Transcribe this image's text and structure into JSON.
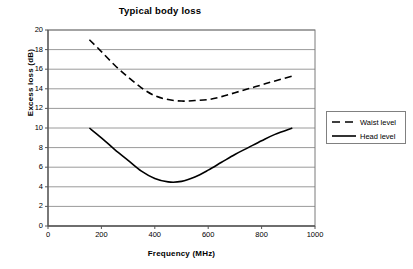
{
  "chart_data": {
    "type": "line",
    "title": "Typical body loss",
    "xlabel": "Frequency (MHz)",
    "ylabel": "Excess loss (dB)",
    "xlim": [
      0,
      1000
    ],
    "ylim": [
      0,
      20
    ],
    "xticks": [
      "0",
      "200",
      "400",
      "600",
      "800",
      "1000"
    ],
    "yticks": [
      "0",
      "2",
      "4",
      "6",
      "8",
      "10",
      "12",
      "14",
      "16",
      "18",
      "20"
    ],
    "grid": "horizontal",
    "legend_position": "right",
    "series": [
      {
        "name": "Waist level",
        "style": "dashed",
        "color": "#000000",
        "x": [
          155,
          200,
          250,
          300,
          350,
          400,
          450,
          500,
          550,
          600,
          650,
          700,
          750,
          800,
          850,
          915
        ],
        "y": [
          19.0,
          17.8,
          16.4,
          15.2,
          14.1,
          13.3,
          12.9,
          12.75,
          12.8,
          12.9,
          13.2,
          13.6,
          14.0,
          14.4,
          14.8,
          15.3
        ]
      },
      {
        "name": "Head level",
        "style": "solid",
        "color": "#000000",
        "x": [
          155,
          200,
          250,
          300,
          350,
          400,
          450,
          500,
          550,
          600,
          650,
          700,
          750,
          800,
          850,
          915
        ],
        "y": [
          10.0,
          9.0,
          7.8,
          6.7,
          5.6,
          4.85,
          4.5,
          4.55,
          5.0,
          5.7,
          6.5,
          7.3,
          8.0,
          8.7,
          9.35,
          10.0
        ]
      }
    ]
  },
  "legend": {
    "items": [
      {
        "label": "Waist level"
      },
      {
        "label": "Head level"
      }
    ]
  }
}
